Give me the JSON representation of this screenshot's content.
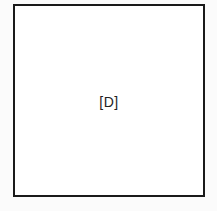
{
  "diagram": {
    "box": {
      "label": "[D]",
      "border_color": "#1a1a1a"
    }
  }
}
